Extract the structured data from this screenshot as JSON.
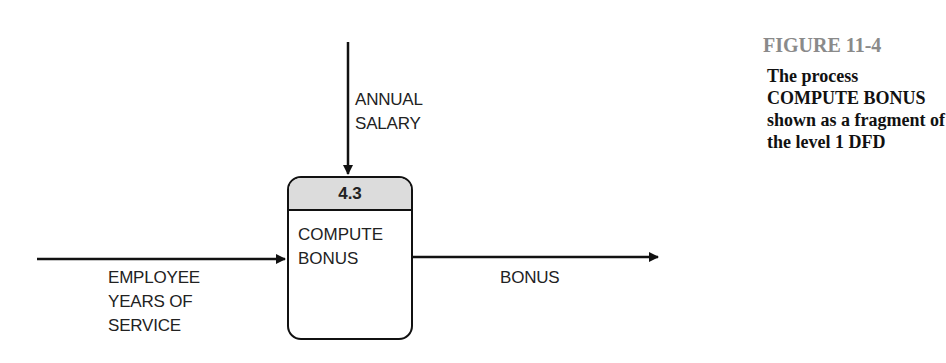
{
  "figure": {
    "number": "FIGURE 11-4",
    "caption": "The process COMPUTE BONUS shown as a fragment of the level 1 DFD"
  },
  "process": {
    "id": "4.3",
    "name_line1": "COMPUTE",
    "name_line2": "BONUS"
  },
  "flows": {
    "top_in": {
      "line1": "ANNUAL",
      "line2": "SALARY"
    },
    "left_in": {
      "line1": "EMPLOYEE",
      "line2": "YEARS OF",
      "line3": "SERVICE"
    },
    "right_out": {
      "line1": "BONUS"
    }
  },
  "colors": {
    "line": "#111111",
    "process_header": "#dcdcdc",
    "figure_number": "#8a8a8a"
  }
}
